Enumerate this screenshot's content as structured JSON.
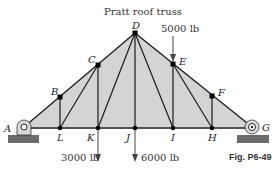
{
  "title": "Pratt roof truss",
  "figure_label": "Fig. P6-49",
  "nodes": {
    "A": "A",
    "B": "B",
    "C": "C",
    "D": "D",
    "E": "E",
    "F": "F",
    "G": "G",
    "H": "H",
    "I": "I",
    "J": "J",
    "K": "K",
    "L": "L"
  },
  "loads": {
    "E": "5000 lb",
    "K": "3000 lb",
    "J": "6000 lb"
  },
  "colors": {
    "fill": "#d4d4d4",
    "member": "#1a1a1a",
    "ground": "#6b6b6b",
    "support": "#d9d9d9"
  }
}
